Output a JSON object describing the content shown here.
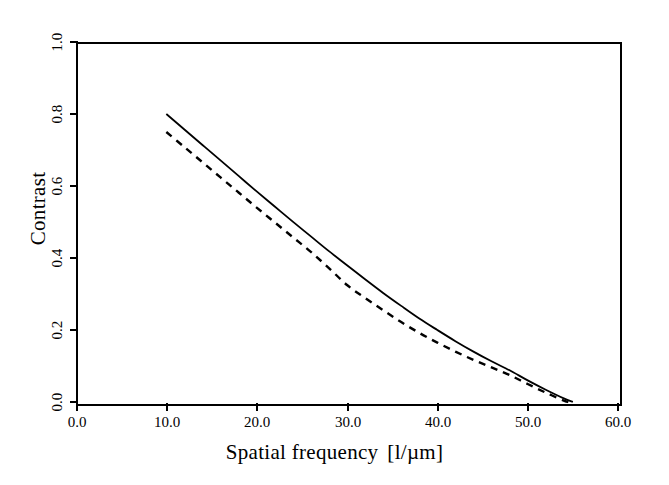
{
  "figure": {
    "background_color": "#ffffff",
    "foreground_color": "#000000"
  },
  "axes": {
    "x": {
      "title": "Spatial frequency",
      "unit": "[l/µm]",
      "tick_labels": [
        "0.0",
        "10.0",
        "20.0",
        "30.0",
        "40.0",
        "50.0",
        "60.0"
      ],
      "tick_values": [
        0,
        10,
        20,
        30,
        40,
        50,
        60
      ],
      "range": [
        0,
        60
      ]
    },
    "y": {
      "title": "Contrast",
      "tick_labels": [
        "0.0",
        "0.2",
        "0.4",
        "0.6",
        "0.8",
        "1.0"
      ],
      "tick_values": [
        0.0,
        0.2,
        0.4,
        0.6,
        0.8,
        1.0
      ],
      "range": [
        0.0,
        1.0
      ]
    }
  },
  "chart_data": {
    "type": "line",
    "title": "",
    "xlabel": "Spatial frequency  [l/µm]",
    "ylabel": "Contrast",
    "xlim": [
      0,
      60
    ],
    "ylim": [
      0.0,
      1.0
    ],
    "grid": false,
    "legend": "none",
    "series": [
      {
        "name": "solid-curve",
        "style": "solid",
        "color": "#000000",
        "x": [
          10,
          12,
          14,
          16,
          18,
          20,
          22,
          24,
          26,
          28,
          30,
          32,
          34,
          36,
          38,
          40,
          42,
          44,
          46,
          48,
          50,
          52,
          54,
          55
        ],
        "y": [
          0.8,
          0.757,
          0.714,
          0.671,
          0.628,
          0.585,
          0.543,
          0.501,
          0.46,
          0.419,
          0.38,
          0.341,
          0.303,
          0.267,
          0.232,
          0.2,
          0.169,
          0.14,
          0.113,
          0.088,
          0.06,
          0.034,
          0.01,
          0.0
        ]
      },
      {
        "name": "dashed-curve",
        "style": "dashed",
        "color": "#000000",
        "x": [
          10,
          12,
          14,
          16,
          18,
          20,
          22,
          24,
          26,
          28,
          30,
          32,
          34,
          36,
          38,
          40,
          42,
          44,
          46,
          48,
          50,
          52,
          54,
          54.5
        ],
        "y": [
          0.75,
          0.708,
          0.666,
          0.624,
          0.582,
          0.54,
          0.499,
          0.458,
          0.417,
          0.372,
          0.325,
          0.289,
          0.255,
          0.222,
          0.192,
          0.165,
          0.14,
          0.117,
          0.096,
          0.075,
          0.05,
          0.026,
          0.004,
          0.0
        ]
      }
    ]
  }
}
